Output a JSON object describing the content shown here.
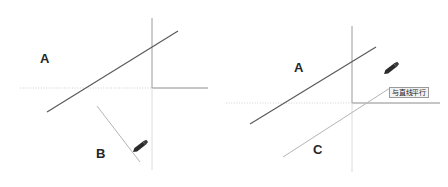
{
  "canvas": {
    "width": 448,
    "height": 187,
    "background": "#ffffff"
  },
  "colors": {
    "line_primary": "#5a5a5a",
    "line_secondary": "#a8a8a8",
    "axis_solid": "#8c8c8c",
    "axis_light": "#cfcfcf",
    "axis_dotted": "#d0d0d0",
    "label_text": "#262626",
    "cursor_fill": "#2b2b2b",
    "tooltip_bg": "#f2f2f2",
    "tooltip_border": "#9a9a9a",
    "tooltip_text": "#1a1a1a"
  },
  "panels": {
    "left": {
      "name": "before-state",
      "labels": {
        "line_a": "A",
        "line_b": "B"
      },
      "axis": {
        "origin_x": 152,
        "origin_y": 88,
        "vertical_top": 18,
        "vertical_bottom": 170,
        "horizontal_left": 20,
        "horizontal_right": 208
      },
      "line_a": {
        "x1": 47,
        "y1": 112,
        "x2": 178,
        "y2": 31
      },
      "line_b": {
        "x1": 97,
        "y1": 106,
        "x2": 140,
        "y2": 162
      },
      "cursor": {
        "x": 133,
        "y": 152,
        "rotation": -38
      },
      "label_a_pos": {
        "x": 40,
        "y": 52
      },
      "label_b_pos": {
        "x": 96,
        "y": 147
      }
    },
    "right": {
      "name": "after-state-parallel-snap",
      "labels": {
        "line_a": "A",
        "line_c": "C"
      },
      "tooltip": {
        "text": "与直线平行",
        "x": 165,
        "y": 87
      },
      "axis": {
        "origin_x": 128,
        "origin_y": 103,
        "vertical_top": 26,
        "vertical_bottom": 172,
        "horizontal_left": 2,
        "horizontal_right": 216
      },
      "line_a": {
        "x1": 26,
        "y1": 124,
        "x2": 152,
        "y2": 47
      },
      "line_c": {
        "x1": 59,
        "y1": 157,
        "x2": 166,
        "y2": 88
      },
      "cursor": {
        "x": 160,
        "y": 74,
        "rotation": -38
      },
      "label_a_pos": {
        "x": 70,
        "y": 61
      },
      "label_c_pos": {
        "x": 89,
        "y": 143
      }
    }
  }
}
